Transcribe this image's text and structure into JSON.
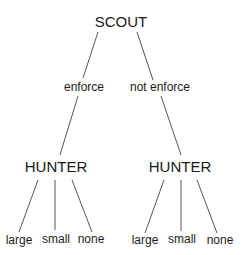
{
  "diagram": {
    "type": "game-tree",
    "root": {
      "label": "SCOUT",
      "children": [
        {
          "edge_label": "enforce",
          "node": {
            "label": "HUNTER",
            "leaves": [
              "large",
              "small",
              "none"
            ]
          }
        },
        {
          "edge_label": "not enforce",
          "node": {
            "label": "HUNTER",
            "leaves": [
              "large",
              "small",
              "none"
            ]
          }
        }
      ]
    }
  },
  "colors": {
    "line": "#555555",
    "text": "#1a1a1a",
    "background": "#ffffff"
  }
}
